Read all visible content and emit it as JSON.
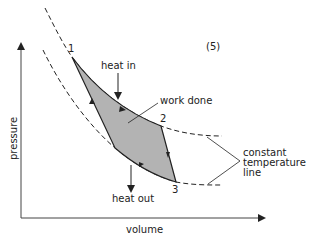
{
  "diagram": {
    "type": "pressure-volume cycle (Carnot-like)",
    "figure_number": "(5)",
    "axes": {
      "x_label": "volume",
      "y_label": "pressure"
    },
    "points": [
      {
        "id": "1",
        "label": "1",
        "x": 72,
        "y": 57
      },
      {
        "id": "2",
        "label": "2",
        "x": 161,
        "y": 126
      },
      {
        "id": "3",
        "label": "3",
        "x": 176,
        "y": 182
      },
      {
        "id": "4",
        "label": "",
        "x": 115,
        "y": 148
      }
    ],
    "annotations": {
      "heat_in": "heat in",
      "work_done": "work done",
      "heat_out": "heat out",
      "isotherm_line1": "constant",
      "isotherm_line2": "temperature",
      "isotherm_line3": "line"
    },
    "colors": {
      "shaded_area": "#b3b3b3",
      "lines": "#222222",
      "text": "#222222",
      "axes": "#444444"
    }
  }
}
